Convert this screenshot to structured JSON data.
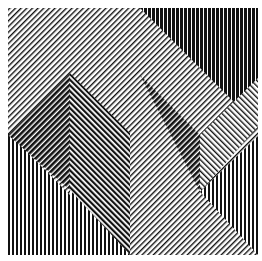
{
  "artwork": {
    "title": "Op-art line composition",
    "description": "Black and white striped geometric composition with two pyramids and diagonal bands",
    "colors": {
      "ink": "#111111",
      "paper": "#ffffff"
    },
    "frame": {
      "x": 8,
      "y": 8,
      "width": 250,
      "height": 247
    }
  }
}
